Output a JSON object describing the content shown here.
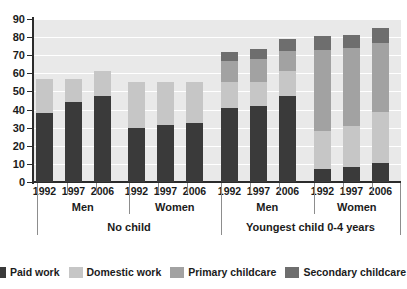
{
  "chart_data": {
    "type": "bar",
    "title": "",
    "xlabel": "",
    "ylabel": "",
    "ylim": [
      0,
      90
    ],
    "ytick_step": 10,
    "yticks": [
      0,
      10,
      20,
      30,
      40,
      50,
      60,
      70,
      80,
      90
    ],
    "grid": true,
    "stacked": true,
    "legend_position": "bottom",
    "categories": [
      "1992",
      "1997",
      "2006",
      "1992",
      "1997",
      "2006",
      "1992",
      "1997",
      "2006",
      "1992",
      "1997",
      "2006"
    ],
    "group_labels": [
      "Men",
      "Women",
      "Men",
      "Women"
    ],
    "supergroup_labels": [
      "No child",
      "Youngest child 0-4 years"
    ],
    "series": [
      {
        "name": "Paid work",
        "color": "#3a3a3a",
        "values": [
          38,
          44,
          47.5,
          30,
          31.5,
          32.5,
          41,
          42,
          47.5,
          7,
          8.5,
          10.5
        ]
      },
      {
        "name": "Domestic work",
        "color": "#c6c6c6",
        "values": [
          19,
          13,
          14,
          25.5,
          24,
          23,
          14,
          13,
          14,
          21,
          22.5,
          28
        ]
      },
      {
        "name": "Primary childcare",
        "color": "#a2a2a2",
        "values": [
          0,
          0,
          0,
          0,
          0,
          0,
          12,
          13,
          11,
          45,
          43,
          38.5
        ]
      },
      {
        "name": "Secondary childcare",
        "color": "#6e6e6e",
        "values": [
          0,
          0,
          0,
          0,
          0,
          0,
          5,
          5.5,
          6.5,
          7.5,
          7,
          8
        ]
      }
    ],
    "totals": [
      57,
      57,
      61.5,
      55.5,
      55.5,
      55.5,
      72,
      73.5,
      79,
      80.5,
      81,
      85
    ]
  },
  "axis": {
    "y_labels": [
      "90",
      "80",
      "70",
      "60",
      "50",
      "40",
      "30",
      "20",
      "10",
      "0"
    ]
  },
  "legend": {
    "items": [
      {
        "label": "Paid work",
        "color": "#3a3a3a",
        "icon": "legend-swatch-paid-work"
      },
      {
        "label": "Domestic work",
        "color": "#c6c6c6",
        "icon": "legend-swatch-domestic-work"
      },
      {
        "label": "Primary childcare",
        "color": "#a2a2a2",
        "icon": "legend-swatch-primary-childcare"
      },
      {
        "label": "Secondary childcare",
        "color": "#6e6e6e",
        "icon": "legend-swatch-secondary-childcare"
      }
    ]
  },
  "groups": [
    {
      "sex": "Men",
      "super": "No child",
      "years": [
        "1992",
        "1997",
        "2006"
      ]
    },
    {
      "sex": "Women",
      "super": "No child",
      "years": [
        "1992",
        "1997",
        "2006"
      ]
    },
    {
      "sex": "Men",
      "super": "Youngest child 0-4 years",
      "years": [
        "1992",
        "1997",
        "2006"
      ]
    },
    {
      "sex": "Women",
      "super": "Youngest child 0-4 years",
      "years": [
        "1992",
        "1997",
        "2006"
      ]
    }
  ]
}
